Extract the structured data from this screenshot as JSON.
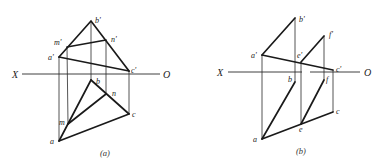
{
  "figure_a": {
    "caption": "(a)",
    "axis": {
      "left_label": "X",
      "right_label": "O"
    },
    "points": {
      "b_prime": "b'",
      "m_prime": "m'",
      "n_prime": "n'",
      "a_prime": "a'",
      "c_prime": "c'",
      "b": "b",
      "n": "n",
      "c": "c",
      "m": "m",
      "a": "a"
    }
  },
  "figure_b": {
    "caption": "(b)",
    "axis": {
      "left_label": "X",
      "right_label": "O"
    },
    "points": {
      "b_prime": "b'",
      "a_prime": "a'",
      "e_prime": "e'",
      "f_prime": "f'",
      "c_prime": "c'",
      "b": "b",
      "f": "f",
      "c": "c",
      "e": "e",
      "a": "a"
    }
  },
  "colors": {
    "line": "#1a1a1a",
    "background": "#ffffff"
  }
}
